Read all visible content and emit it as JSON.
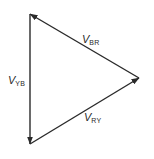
{
  "diagram": {
    "type": "phasor-triangle",
    "colors": {
      "line": "#2a2a2a",
      "background": "#ffffff"
    },
    "vertices": {
      "top_left": [
        30,
        14
      ],
      "right": [
        139,
        78
      ],
      "bottom_left": [
        30,
        144
      ]
    },
    "phasors": [
      {
        "id": "v_br",
        "symbol": "V",
        "subscript": "BR",
        "from": "right",
        "to": "top_left"
      },
      {
        "id": "v_yb",
        "symbol": "V",
        "subscript": "YB",
        "from": "top_left",
        "to": "bottom_left"
      },
      {
        "id": "v_ry",
        "symbol": "V",
        "subscript": "RY",
        "from": "bottom_left",
        "to": "right"
      }
    ]
  }
}
